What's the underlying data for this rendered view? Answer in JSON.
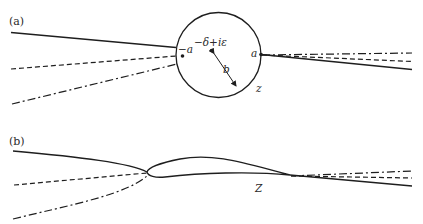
{
  "figure": {
    "panel_a": {
      "label": "(a)",
      "plane_label": "z",
      "circle": {
        "center_label": "−δ+iε",
        "radius_label": "b"
      },
      "points": {
        "left": "−a",
        "right": "a"
      },
      "streamlines": [
        "solid",
        "dashed",
        "dash-dot"
      ]
    },
    "panel_b": {
      "label": "(b)",
      "plane_label": "Z",
      "shape": "airfoil",
      "streamlines": [
        "solid",
        "dashed",
        "dash-dot"
      ]
    },
    "colors": {
      "ink": "#1e1e1e",
      "background": "#ffffff"
    }
  }
}
